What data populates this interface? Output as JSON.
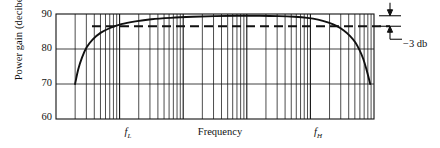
{
  "figure": {
    "title": "",
    "background": "#ffffff",
    "ink": "#111111",
    "width": 440,
    "height": 148
  },
  "axes": {
    "y_label": "Power gain  (decibels)",
    "y_ticks": [
      "90",
      "80",
      "70",
      "60"
    ],
    "y_tick_values": [
      90,
      80,
      70,
      60
    ],
    "x_caption": "Frequency",
    "x_marks": [
      {
        "name": "f-low",
        "text_main": "f",
        "text_sub": "L"
      },
      {
        "name": "f-high",
        "text_main": "f",
        "text_sub": "H"
      }
    ]
  },
  "annotations": {
    "minus_3db": "−3 db"
  },
  "chart_data": {
    "type": "line",
    "title": "",
    "xlabel": "Frequency",
    "ylabel": "Power gain  (decibels)",
    "xscale": "log",
    "yscale": "linear",
    "ylim": [
      60,
      90
    ],
    "xlim_decades": 5,
    "grid": "log-minor vertical gridlines, horizontal gridlines at 70 and 80 dB",
    "legend": "none",
    "y_tick_values": [
      60,
      70,
      80,
      90
    ],
    "midband_gain_db": 89.5,
    "half_power_level_db": 86.5,
    "bandwidth_drop_db": 3,
    "cutoffs": {
      "f_low_label": "fL",
      "f_low_x_frac": 0.226,
      "f_high_label": "fH",
      "f_high_x_frac": 0.824
    },
    "dashed_reference_line_db": 86.5,
    "series": [
      {
        "name": "power gain",
        "style": "solid",
        "points_xfrac_ydb": [
          [
            0.06,
            70.0
          ],
          [
            0.07,
            74.2
          ],
          [
            0.082,
            77.6
          ],
          [
            0.096,
            80.4
          ],
          [
            0.115,
            82.7
          ],
          [
            0.14,
            84.6
          ],
          [
            0.17,
            86.0
          ],
          [
            0.205,
            87.1
          ],
          [
            0.25,
            87.9
          ],
          [
            0.3,
            88.5
          ],
          [
            0.36,
            88.9
          ],
          [
            0.43,
            89.2
          ],
          [
            0.5,
            89.4
          ],
          [
            0.57,
            89.5
          ],
          [
            0.64,
            89.5
          ],
          [
            0.7,
            89.4
          ],
          [
            0.75,
            89.2
          ],
          [
            0.79,
            88.9
          ],
          [
            0.824,
            88.4
          ],
          [
            0.855,
            87.6
          ],
          [
            0.882,
            86.6
          ],
          [
            0.905,
            85.3
          ],
          [
            0.925,
            83.7
          ],
          [
            0.942,
            81.8
          ],
          [
            0.955,
            79.6
          ],
          [
            0.966,
            77.2
          ],
          [
            0.975,
            74.6
          ],
          [
            0.982,
            72.2
          ],
          [
            0.988,
            70.0
          ]
        ]
      },
      {
        "name": "3 db reference",
        "style": "dashed",
        "constant_y_db": 86.5
      }
    ]
  }
}
